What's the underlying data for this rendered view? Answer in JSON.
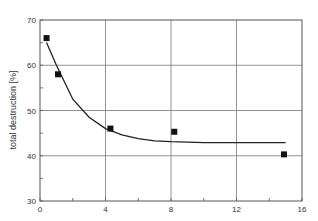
{
  "chart_data": {
    "type": "scatter",
    "title": "",
    "xlabel": "",
    "ylabel": "total destruction [%]",
    "xlim": [
      0,
      16
    ],
    "ylim": [
      30,
      70
    ],
    "x_ticks": [
      0,
      4,
      8,
      12,
      16
    ],
    "y_ticks": [
      30,
      40,
      50,
      60,
      70
    ],
    "grid": true,
    "legend": null,
    "series": [
      {
        "name": "measured",
        "style": "square-markers",
        "x": [
          0.4,
          1.1,
          4.3,
          8.2,
          14.9
        ],
        "y": [
          66,
          58,
          46,
          45.3,
          40.3
        ]
      },
      {
        "name": "fit",
        "style": "line",
        "x": [
          0.4,
          1.0,
          2.0,
          3.0,
          4.0,
          5.0,
          6.0,
          7.0,
          8.0,
          10.0,
          12.0,
          15.0
        ],
        "y": [
          65,
          60,
          52.5,
          48.5,
          46,
          44.6,
          43.8,
          43.3,
          43.1,
          42.9,
          42.9,
          42.9
        ]
      }
    ]
  },
  "axis": {
    "ylabel": "total destruction [%]",
    "x_tick_labels": [
      "0",
      "4",
      "8",
      "12",
      "16"
    ],
    "y_tick_labels": [
      "30",
      "40",
      "50",
      "60",
      "70"
    ]
  }
}
